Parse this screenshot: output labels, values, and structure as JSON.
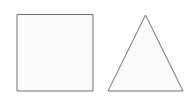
{
  "canvas": {
    "width": 194,
    "height": 106,
    "background_color": "#ffffff",
    "title": "Geometric Shapes"
  },
  "style": {
    "stroke_color": "#707070",
    "stroke_width": 1,
    "fill_color": "#fafafa"
  },
  "shapes": [
    {
      "name": "square",
      "type": "rect",
      "label": "Square",
      "x": 17,
      "y": 14.5,
      "width": 76,
      "height": 76.5,
      "stroke_color": "#707070",
      "fill_color": "#fafafa",
      "stroke_width": 1
    },
    {
      "name": "triangle",
      "type": "polygon",
      "label": "Triangle",
      "points": "145.5,15 183,91 108,91",
      "vertices": [
        {
          "name": "apex",
          "x": 145.5,
          "y": 15
        },
        {
          "name": "base-right",
          "x": 183,
          "y": 91
        },
        {
          "name": "base-left",
          "x": 108,
          "y": 91
        }
      ],
      "stroke_color": "#707070",
      "fill_color": "#fafafa",
      "stroke_width": 1
    }
  ]
}
